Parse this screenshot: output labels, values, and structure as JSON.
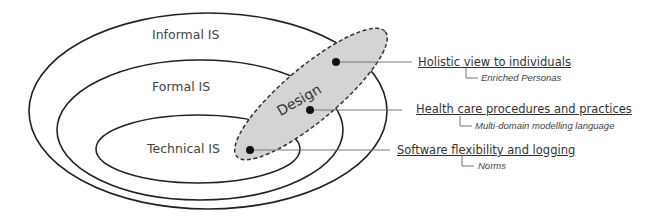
{
  "layers": [
    {
      "id": "informal",
      "label": "Informal IS"
    },
    {
      "id": "formal",
      "label": "Formal IS"
    },
    {
      "id": "technical",
      "label": "Technical IS"
    }
  ],
  "design": {
    "label": "Design"
  },
  "annotations": [
    {
      "title": "Holistic view to individuals",
      "detail": "Enriched Personas"
    },
    {
      "title": "Health care procedures and practices",
      "detail": "Multi-domain modelling language"
    },
    {
      "title": "Software flexibility and logging",
      "detail": "Norms"
    }
  ],
  "colors": {
    "stroke": "#222222",
    "design_fill": "#d4d4d4",
    "connector": "#777777"
  }
}
